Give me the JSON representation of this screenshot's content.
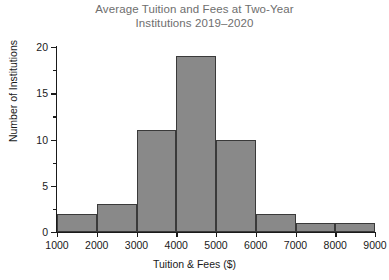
{
  "chart_data": {
    "type": "bar",
    "title": "Average Tuition and Fees at Two-Year Institutions 2019–2020",
    "title_lines": [
      "Average Tuition and Fees at Two-Year",
      "Institutions 2019–2020"
    ],
    "xlabel": "Tuition & Fees ($)",
    "ylabel": "Number of Institutions",
    "categories": [
      "1000–2000",
      "2000–3000",
      "3000–4000",
      "4000–5000",
      "5000–6000",
      "6000–7000",
      "7000–8000",
      "8000–9000"
    ],
    "bin_edges": [
      1000,
      2000,
      3000,
      4000,
      5000,
      6000,
      7000,
      8000,
      9000
    ],
    "values": [
      2,
      3,
      11,
      19,
      10,
      2,
      1,
      1
    ],
    "xlim": [
      1000,
      9000
    ],
    "ylim": [
      0,
      20
    ],
    "x_tick_labels": [
      "1000",
      "2000",
      "3000",
      "4000",
      "5000",
      "6000",
      "7000",
      "8000",
      "9000"
    ],
    "x_tick_values": [
      1000,
      2000,
      3000,
      4000,
      5000,
      6000,
      7000,
      8000,
      9000
    ],
    "y_tick_labels": [
      "0",
      "5",
      "10",
      "15",
      "20"
    ],
    "y_tick_values": [
      0,
      5,
      10,
      15,
      20
    ],
    "y_minor_tick_values": [
      2.5,
      7.5,
      12.5,
      17.5
    ],
    "grid": false,
    "legend": false,
    "bar_fill_color": "#898989",
    "bar_edge_color": "#3a3a3a",
    "title_color": "#6e6e6e",
    "axis_color": "#1a1a1a",
    "background_color": "#ffffff"
  }
}
